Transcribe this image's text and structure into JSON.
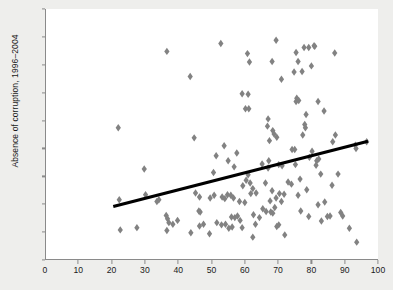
{
  "chart_data": {
    "type": "scatter",
    "title": "",
    "xlabel": "",
    "ylabel": "Absence of corruption, 1996–2004",
    "xlim": [
      0,
      100
    ],
    "ylim": [
      -1.5,
      3.0
    ],
    "xticks": [
      0,
      10,
      20,
      30,
      40,
      50,
      60,
      70,
      80,
      90,
      100
    ],
    "yticks": [
      -1.5,
      -1.0,
      -0.5,
      0.0,
      0.5,
      1.0,
      1.5,
      2.0,
      2.5,
      3.0
    ],
    "xtick_labels": [
      "0",
      "10",
      "20",
      "30",
      "40",
      "50",
      "60",
      "70",
      "80",
      "90",
      "100"
    ],
    "ytick_labels": [
      "−1.5",
      "−1.0",
      "−0.5",
      "0.0",
      "0.5",
      "1.0",
      "1.5",
      "2.0",
      "2.5",
      "3.0"
    ],
    "grid": false,
    "legend": null,
    "marker": {
      "shape": "diamond",
      "color": "#828282",
      "size_px": 6
    },
    "trendline": {
      "type": "linear",
      "color": "#000000",
      "width_px": 3.2,
      "x_start": 20.5,
      "y_start": -0.54,
      "x_end": 97.0,
      "y_end": 0.63
    },
    "points": [
      [
        22.0,
        0.87
      ],
      [
        22.3,
        -0.42
      ],
      [
        22.6,
        -0.96
      ],
      [
        27.6,
        -0.92
      ],
      [
        29.8,
        0.13
      ],
      [
        30.2,
        -0.33
      ],
      [
        33.6,
        -0.45
      ],
      [
        34.2,
        -0.42
      ],
      [
        36.6,
        2.24
      ],
      [
        36.4,
        -0.7
      ],
      [
        36.8,
        -0.76
      ],
      [
        36.6,
        -0.97
      ],
      [
        37.2,
        -0.83
      ],
      [
        38.4,
        -0.86
      ],
      [
        39.8,
        -0.79
      ],
      [
        43.6,
        1.79
      ],
      [
        43.8,
        -1.01
      ],
      [
        44.8,
        0.69
      ],
      [
        45.2,
        -0.3
      ],
      [
        46.4,
        -0.37
      ],
      [
        46.2,
        -0.62
      ],
      [
        46.6,
        -0.64
      ],
      [
        46.4,
        -0.89
      ],
      [
        47.6,
        -0.86
      ],
      [
        49.6,
        -0.39
      ],
      [
        49.4,
        -1.03
      ],
      [
        50.6,
        0.07
      ],
      [
        50.8,
        -0.34
      ],
      [
        51.4,
        0.37
      ],
      [
        51.6,
        -0.83
      ],
      [
        52.8,
        2.38
      ],
      [
        53.2,
        -0.37
      ],
      [
        53.0,
        -0.87
      ],
      [
        53.8,
        0.55
      ],
      [
        54.0,
        -0.4
      ],
      [
        54.2,
        -0.86
      ],
      [
        55.0,
        0.28
      ],
      [
        54.8,
        -0.33
      ],
      [
        55.2,
        -0.93
      ],
      [
        55.8,
        -0.34
      ],
      [
        56.0,
        -0.73
      ],
      [
        56.2,
        -0.91
      ],
      [
        56.8,
        0.17
      ],
      [
        56.6,
        -0.39
      ],
      [
        57.0,
        -0.74
      ],
      [
        57.6,
        0.42
      ],
      [
        57.8,
        -0.71
      ],
      [
        58.4,
        -0.45
      ],
      [
        58.6,
        -0.79
      ],
      [
        59.2,
        1.48
      ],
      [
        59.4,
        -0.17
      ],
      [
        59.2,
        -0.92
      ],
      [
        60.2,
        1.21
      ],
      [
        60.4,
        -0.07
      ],
      [
        60.0,
        -0.47
      ],
      [
        60.8,
        2.2
      ],
      [
        61.0,
        1.47
      ],
      [
        61.2,
        1.21
      ],
      [
        61.0,
        0.03
      ],
      [
        61.4,
        2.05
      ],
      [
        61.6,
        -0.12
      ],
      [
        61.8,
        -0.31
      ],
      [
        62.4,
        -0.22
      ],
      [
        62.6,
        -0.69
      ],
      [
        62.4,
        -1.09
      ],
      [
        63.4,
        -0.3
      ],
      [
        63.2,
        -0.86
      ],
      [
        64.4,
        -0.74
      ],
      [
        65.2,
        0.22
      ],
      [
        65.4,
        -0.58
      ],
      [
        66.2,
        -0.12
      ],
      [
        66.4,
        -0.63
      ],
      [
        67.0,
        1.03
      ],
      [
        66.8,
        0.9
      ],
      [
        67.2,
        0.28
      ],
      [
        67.0,
        0.15
      ],
      [
        67.4,
        0.64
      ],
      [
        67.6,
        -0.44
      ],
      [
        67.8,
        -0.64
      ],
      [
        68.2,
        2.06
      ],
      [
        68.4,
        0.82
      ],
      [
        68.2,
        -0.26
      ],
      [
        68.4,
        -0.66
      ],
      [
        68.8,
        0.76
      ],
      [
        69.0,
        -0.56
      ],
      [
        69.4,
        2.44
      ],
      [
        69.6,
        0.7
      ],
      [
        69.4,
        -0.39
      ],
      [
        69.6,
        -0.9
      ],
      [
        70.2,
        0.21
      ],
      [
        70.4,
        -0.31
      ],
      [
        70.2,
        -0.87
      ],
      [
        71.0,
        1.74
      ],
      [
        71.2,
        0.19
      ],
      [
        71.0,
        -0.45
      ],
      [
        71.8,
        -0.32
      ],
      [
        72.0,
        -1.05
      ],
      [
        73.0,
        -0.1
      ],
      [
        74.2,
        0.48
      ],
      [
        74.0,
        -0.14
      ],
      [
        74.8,
        1.87
      ],
      [
        75.0,
        0.48
      ],
      [
        75.2,
        0.21
      ],
      [
        75.4,
        2.22
      ],
      [
        75.6,
        1.4
      ],
      [
        75.4,
        1.34
      ],
      [
        76.0,
        2.06
      ],
      [
        76.2,
        1.36
      ],
      [
        76.0,
        -0.34
      ],
      [
        76.6,
        -0.05
      ],
      [
        76.8,
        -0.62
      ],
      [
        77.2,
        1.88
      ],
      [
        77.4,
        0.74
      ],
      [
        77.8,
        2.31
      ],
      [
        78.0,
        0.93
      ],
      [
        78.2,
        0.87
      ],
      [
        78.4,
        1.11
      ],
      [
        78.6,
        -0.24
      ],
      [
        79.2,
        2.31
      ],
      [
        79.4,
        0.34
      ],
      [
        79.2,
        -0.72
      ],
      [
        80.0,
        1.98
      ],
      [
        80.2,
        0.45
      ],
      [
        80.8,
        2.34
      ],
      [
        81.0,
        2.33
      ],
      [
        81.4,
        0.2
      ],
      [
        81.6,
        0.28
      ],
      [
        82.0,
        1.34
      ],
      [
        82.2,
        0.31
      ],
      [
        82.0,
        -0.51
      ],
      [
        82.8,
        0.04
      ],
      [
        83.0,
        -0.8
      ],
      [
        83.8,
        1.17
      ],
      [
        84.0,
        -0.46
      ],
      [
        84.8,
        -0.72
      ],
      [
        85.6,
        -0.71
      ],
      [
        86.4,
        0.62
      ],
      [
        86.2,
        -0.16
      ],
      [
        87.0,
        2.21
      ],
      [
        87.2,
        0.74
      ],
      [
        88.0,
        0.04
      ],
      [
        88.8,
        -0.65
      ],
      [
        89.4,
        -0.71
      ],
      [
        91.4,
        -0.93
      ],
      [
        93.2,
        0.56
      ],
      [
        93.4,
        0.5
      ],
      [
        93.6,
        -1.18
      ],
      [
        96.6,
        0.62
      ]
    ]
  }
}
